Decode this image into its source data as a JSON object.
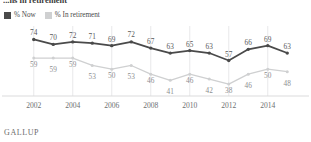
{
  "headline": {
    "clipped_text": "...ns in retirement"
  },
  "legend": {
    "position": "top-left",
    "items": [
      {
        "label": "% Now",
        "color": "#4a4a4a",
        "swatch": "legend-swatch-now"
      },
      {
        "label": "% In retirement",
        "color": "#cfd0d1",
        "swatch": "legend-swatch-retirement"
      }
    ]
  },
  "footer": {
    "source": "GALLUP"
  },
  "colors": {
    "series_now": "#4a4a4a",
    "series_retirement": "#cfd0d1",
    "gridline": "#e3e3e4",
    "axis": "#d7d7d8",
    "value_label_now": "#595a5c",
    "value_label_retirement": "#8d8e90",
    "tick_label": "#6e6f72"
  },
  "chart_data": {
    "type": "line",
    "title": "",
    "subtitle": "",
    "xlabel": "",
    "ylabel": "",
    "grid": true,
    "gridlines_at": [
      2002,
      2004,
      2006,
      2008,
      2010,
      2012,
      2014
    ],
    "legend_position": "top-left",
    "x": [
      2002,
      2003,
      2004,
      2005,
      2006,
      2007,
      2008,
      2009,
      2010,
      2011,
      2012,
      2013,
      2014,
      2015
    ],
    "xtick_labels": [
      "2002",
      "2004",
      "2006",
      "2008",
      "2010",
      "2012",
      "2014"
    ],
    "xticks": [
      2002,
      2004,
      2006,
      2008,
      2010,
      2012,
      2014
    ],
    "xlim": [
      2001.5,
      2015.5
    ],
    "ylim": [
      30,
      80
    ],
    "series": [
      {
        "name": "% Now",
        "color": "#4a4a4a",
        "values": [
          74,
          70,
          72,
          71,
          69,
          72,
          67,
          63,
          65,
          63,
          57,
          66,
          69,
          63
        ]
      },
      {
        "name": "% In retirement",
        "color": "#cfd0d1",
        "values": [
          59,
          59,
          59,
          53,
          50,
          53,
          46,
          41,
          46,
          42,
          38,
          46,
          50,
          48
        ]
      }
    ]
  }
}
